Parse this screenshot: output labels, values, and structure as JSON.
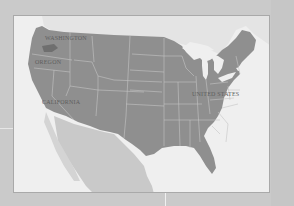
{
  "map": {
    "title": "",
    "region": "United States",
    "labels": {
      "washington": "Washington",
      "oregon": "Oregon",
      "california": "California",
      "united_states": "United States"
    },
    "colors": {
      "background": "#cacaca",
      "frame_border": "#a9a9a9",
      "water": "#efefef",
      "us_land": "#8f8f8f",
      "foreign_land": "#bdbdbd",
      "state_borders": "#c4c4c4",
      "label_text": "#5e5e5e"
    }
  }
}
